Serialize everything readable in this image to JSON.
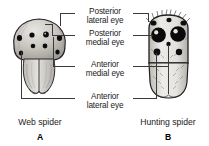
{
  "figure": {
    "title_implicit": "Spider eye arrangement comparison",
    "background_color": "#ffffff",
    "ink_color": "#1a1a1a"
  },
  "labels": [
    {
      "id": "posterior-lateral-eye",
      "line1": "Posterior",
      "line2": "lateral eye"
    },
    {
      "id": "posterior-medial-eye",
      "line1": "Posterior",
      "line2": "medial eye"
    },
    {
      "id": "anterior-medial-eye",
      "line1": "Anterior",
      "line2": "medial eye"
    },
    {
      "id": "anterior-lateral-eye",
      "line1": "Anterior",
      "line2": "lateral eye"
    }
  ],
  "panels": [
    {
      "id": "web-spider",
      "caption": "Web spider",
      "letter": "A"
    },
    {
      "id": "hunting-spider",
      "caption": "Hunting spider",
      "letter": "B"
    }
  ]
}
